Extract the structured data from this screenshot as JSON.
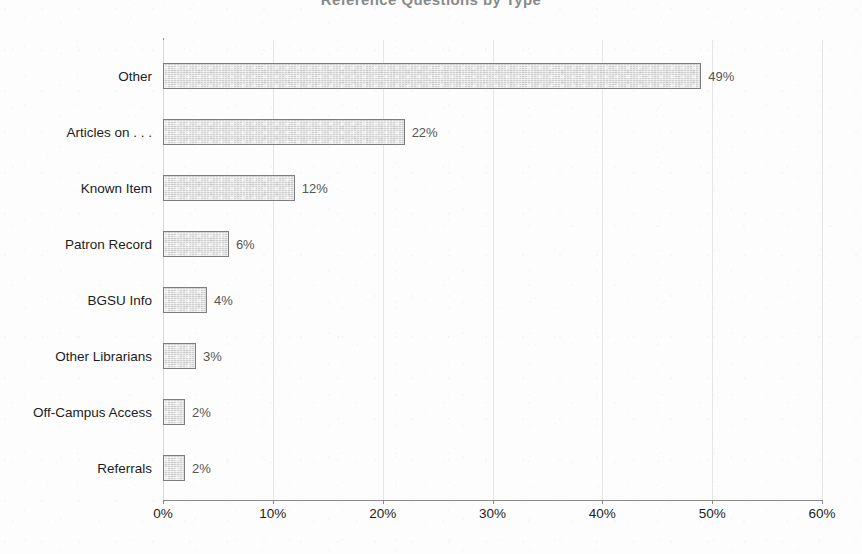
{
  "chart_data": {
    "type": "bar",
    "orientation": "horizontal",
    "title": "Reference Questions by Type",
    "xlabel": "",
    "ylabel": "",
    "categories": [
      "Other",
      "Articles on . . .",
      "Known Item",
      "Patron Record",
      "BGSU Info",
      "Other Librarians",
      "Off-Campus Access",
      "Referrals"
    ],
    "values": [
      49,
      22,
      12,
      6,
      4,
      3,
      2,
      2
    ],
    "value_labels": [
      "49%",
      "22%",
      "12%",
      "6%",
      "4%",
      "3%",
      "2%",
      "2%"
    ],
    "xlim": [
      0,
      60
    ],
    "xticks": [
      0,
      10,
      20,
      30,
      40,
      50,
      60
    ],
    "xtick_labels": [
      "0%",
      "10%",
      "20%",
      "30%",
      "40%",
      "50%",
      "60%"
    ],
    "grid": true,
    "grid_axis": "x",
    "legend": null,
    "bar_fill": "#dcdcdc",
    "bar_border": "#7d7d7d",
    "axis_color": "#8a8a8a",
    "label_color": "#1c1c1c",
    "value_label_color": "#555555",
    "background": "#fdfdfd"
  }
}
